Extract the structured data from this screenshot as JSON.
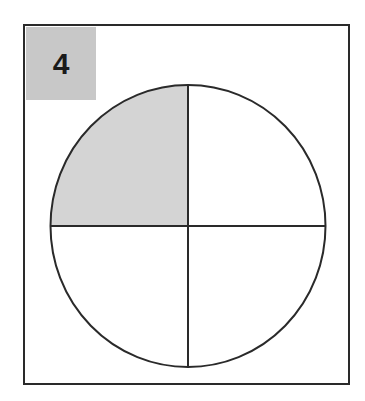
{
  "label": "4",
  "colors": {
    "border": "#2a2a2a",
    "label_fill": "#c8c8c8",
    "shaded_fill": "#d4d4d4",
    "background": "#ffffff"
  },
  "figure": {
    "shape": "circle",
    "parts": 4,
    "shaded_parts": 1,
    "shaded_quadrant": "top-left"
  }
}
